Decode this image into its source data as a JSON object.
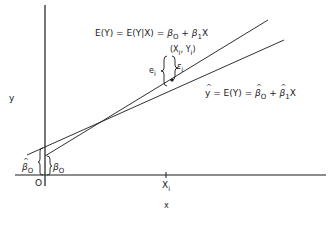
{
  "diagram": {
    "type": "linear regression illustration",
    "axes": {
      "x_label": "x",
      "y_label": "y",
      "origin_label": "O",
      "x_tick_label": "X",
      "x_tick_sub": "i"
    },
    "true_line": {
      "label_prefix": "E(Y) = E(Y|X) = ",
      "beta": "β",
      "sub0": "O",
      "plus": " + ",
      "sub1": "1",
      "suffix": "X"
    },
    "fitted_line": {
      "label_y": "y",
      "label_mid": " = E(Y) = ",
      "beta": "β",
      "sub0": "O",
      "plus": " + ",
      "sub1": "1",
      "suffix": "X"
    },
    "point_label": {
      "open": "(X",
      "sub_x": "i",
      "sep": ", Y",
      "sub_y": "i",
      "close": ")"
    },
    "residual_label": {
      "symbol": "e",
      "sub": "i"
    },
    "error_label": {
      "symbol": "ε",
      "sub": "i"
    },
    "intercepts": {
      "estimated": {
        "symbol": "β",
        "sub": "O"
      },
      "true": {
        "symbol": "β",
        "sub": "O"
      }
    },
    "colors": {
      "ink": "#1a1a1a",
      "background": "#ffffff"
    }
  }
}
